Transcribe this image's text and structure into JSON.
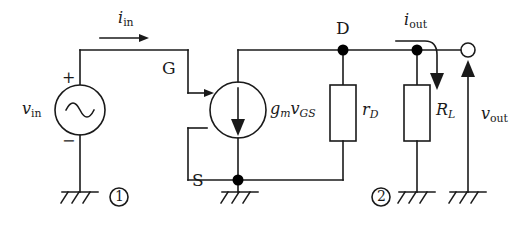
{
  "figure": {
    "kind": "circuit-schematic",
    "line_color": "#1a1a1a",
    "background_color": "#ffffff",
    "node_fill": "#000000"
  },
  "labels": {
    "current_in": {
      "symbol": "i",
      "subscript": "in",
      "text": "i_in"
    },
    "current_out": {
      "symbol": "i",
      "subscript": "out",
      "text": "i_out"
    },
    "voltage_in": {
      "symbol": "v",
      "subscript": "in",
      "text": "v_in"
    },
    "voltage_out": {
      "symbol": "v",
      "subscript": "out",
      "text": "v_out"
    },
    "gate": "G",
    "drain": "D",
    "source_terminal": "S",
    "dependent_source": {
      "gain": "g",
      "gain_sub": "m",
      "ctrl": "v",
      "ctrl_sub": "GS",
      "text": "g_m v_GS"
    },
    "resistor_rd": {
      "symbol": "r",
      "subscript": "D",
      "text": "r_D"
    },
    "resistor_rl": {
      "symbol": "R",
      "subscript": "L",
      "text": "R_L"
    },
    "plus_sign": "+",
    "minus_sign": "−",
    "node_marker_1": "1",
    "node_marker_2": "2"
  },
  "components": [
    {
      "name": "ac-voltage-source",
      "label": "v_in",
      "terminals": [
        "+",
        "−"
      ]
    },
    {
      "name": "dependent-current-source",
      "label": "g_m v_GS",
      "direction": "downward"
    },
    {
      "name": "resistor-rd",
      "label": "r_D"
    },
    {
      "name": "resistor-rl",
      "label": "R_L"
    },
    {
      "name": "ground-1",
      "marker": "1"
    },
    {
      "name": "ground-source",
      "marker": ""
    },
    {
      "name": "ground-2",
      "marker": "2"
    },
    {
      "name": "ground-output",
      "marker": ""
    },
    {
      "name": "output-terminal",
      "style": "open-circle"
    }
  ]
}
